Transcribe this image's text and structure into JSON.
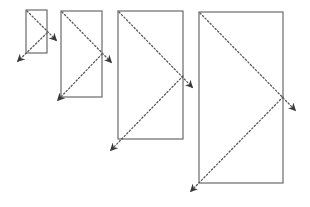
{
  "diagram": {
    "colors": {
      "rect_stroke": "#6a6a6a",
      "path_stroke": "#5a5a5a",
      "arrow_fill": "#3a3a3a",
      "background": "#ffffff"
    },
    "rectangles": [
      {
        "id": "rect-1",
        "x": 26,
        "y": 10,
        "w": 21,
        "h": 43,
        "mid_y": 33,
        "arrow1_tip": [
          56,
          40
        ],
        "arrow2_tip": [
          18,
          61
        ]
      },
      {
        "id": "rect-2",
        "x": 61,
        "y": 11,
        "w": 41,
        "h": 86,
        "mid_y": 54,
        "arrow1_tip": [
          111,
          62
        ],
        "arrow2_tip": [
          58,
          100
        ]
      },
      {
        "id": "rect-3",
        "x": 118,
        "y": 11,
        "w": 65,
        "h": 128,
        "mid_y": 76,
        "arrow1_tip": [
          192,
          87
        ],
        "arrow2_tip": [
          111,
          150
        ]
      },
      {
        "id": "rect-4",
        "x": 199,
        "y": 12,
        "w": 84,
        "h": 171,
        "mid_y": 97,
        "arrow1_tip": [
          295,
          110
        ],
        "arrow2_tip": [
          191,
          191
        ]
      }
    ]
  }
}
